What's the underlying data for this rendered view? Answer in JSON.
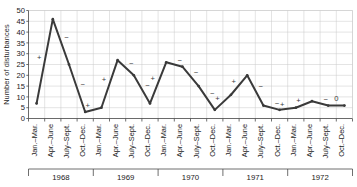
{
  "chart_data": {
    "type": "line",
    "title": "",
    "xlabel": "",
    "ylabel": "Number of disturbances",
    "ylim": [
      0,
      50
    ],
    "yticks": [
      0,
      5,
      10,
      15,
      20,
      25,
      30,
      35,
      40,
      45,
      50
    ],
    "grid": true,
    "legend": null,
    "categories": [
      "Jan.–Mar.",
      "Apr.–June",
      "July–Sept.",
      "Oct.–Dec.",
      "Jan.–Mar.",
      "Apr.–June",
      "July–Sept.",
      "Oct.–Dec.",
      "Jan.–Mar.",
      "Apr.–June",
      "July–Sept.",
      "Oct.–Dec.",
      "Jan.–Mar.",
      "Apr.–June",
      "July–Sept.",
      "Oct.–Dec.",
      "Jan.–Mar.",
      "Apr.–June",
      "July–Sept.",
      "Oct.–Dec."
    ],
    "values": [
      7,
      46,
      25,
      3,
      5,
      27,
      20,
      7,
      26,
      24,
      15,
      4,
      11,
      20,
      6,
      4,
      5,
      8,
      6,
      6
    ],
    "year_groups": [
      {
        "label": "1968",
        "start": 0,
        "end": 3
      },
      {
        "label": "1969",
        "start": 4,
        "end": 7
      },
      {
        "label": "1970",
        "start": 8,
        "end": 11
      },
      {
        "label": "1971",
        "start": 12,
        "end": 15
      },
      {
        "label": "1972",
        "start": 16,
        "end": 19
      }
    ],
    "annotations": [
      {
        "between": [
          0,
          1
        ],
        "text": "+"
      },
      {
        "between": [
          1,
          2
        ],
        "text": "−"
      },
      {
        "between": [
          2,
          3
        ],
        "text": "−"
      },
      {
        "between": [
          3,
          4
        ],
        "text": "+"
      },
      {
        "between": [
          4,
          5
        ],
        "text": "+"
      },
      {
        "between": [
          5,
          6
        ],
        "text": "−"
      },
      {
        "between": [
          6,
          7
        ],
        "text": "−"
      },
      {
        "between": [
          7,
          8
        ],
        "text": "+"
      },
      {
        "between": [
          8,
          9
        ],
        "text": "−"
      },
      {
        "between": [
          9,
          10
        ],
        "text": "−"
      },
      {
        "between": [
          10,
          11
        ],
        "text": "−"
      },
      {
        "between": [
          11,
          12
        ],
        "text": "+"
      },
      {
        "between": [
          12,
          13
        ],
        "text": "+"
      },
      {
        "between": [
          13,
          14
        ],
        "text": "−"
      },
      {
        "between": [
          14,
          15
        ],
        "text": "−"
      },
      {
        "between": [
          15,
          16
        ],
        "text": "+"
      },
      {
        "between": [
          16,
          17
        ],
        "text": "+"
      },
      {
        "between": [
          17,
          18
        ],
        "text": "−"
      },
      {
        "between": [
          18,
          19
        ],
        "text": "0"
      }
    ]
  }
}
